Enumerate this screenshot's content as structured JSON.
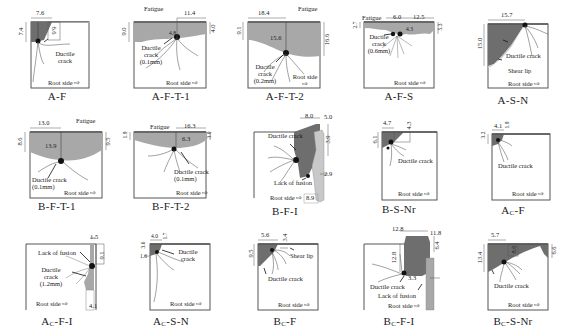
{
  "figure": {
    "root_side_label": "Root side ⇨",
    "panels": [
      {
        "id": "A-F",
        "caption": "A-F",
        "dims": [
          "7.6",
          "7.4",
          "6.6"
        ],
        "labels": [
          "Ductile crack"
        ]
      },
      {
        "id": "A-F-T-1",
        "caption": "A-F-T-1",
        "dims": [
          "9.0",
          "11.4",
          "4.8",
          "4.0"
        ],
        "labels": [
          "Fatigue",
          "Ductile crack (0.1mm)"
        ]
      },
      {
        "id": "A-F-T-2",
        "caption": "A-F-T-2",
        "dims": [
          "18.4",
          "9.1",
          "15.6",
          "16.6"
        ],
        "labels": [
          "Fatigue",
          "Ductile crack (0.2mm)",
          "Root side ⇨"
        ]
      },
      {
        "id": "A-F-S",
        "caption": "A-F-S",
        "dims": [
          "6.0",
          "12.5",
          "2.7",
          "4.3",
          "5.3"
        ],
        "labels": [
          "Fatigue",
          "Ductile crack (0.6mm)"
        ]
      },
      {
        "id": "A-S-N",
        "caption": "A-S-N",
        "dims": [
          "15.7",
          "15.0"
        ],
        "labels": [
          "Ductile crack",
          "Shear lip"
        ]
      },
      {
        "id": "B-F-T-1",
        "caption": "B-F-T-1",
        "dims": [
          "13.0",
          "8.6",
          "13.9",
          "9.5"
        ],
        "labels": [
          "Fatigue",
          "Ductile crack (0.1mm)"
        ]
      },
      {
        "id": "B-F-T-2",
        "caption": "B-F-T-2",
        "dims": [
          "16.3",
          "1.9",
          "6.3",
          "3.0"
        ],
        "labels": [
          "Fatigue",
          "Ductile crack (0.1mm)"
        ]
      },
      {
        "id": "B-F-I",
        "caption": "B-F-I",
        "dims": [
          "8.0",
          "5.0",
          "3.9",
          "2.9",
          "8.9"
        ],
        "labels": [
          "Ductile crack",
          "Lack of fusion"
        ]
      },
      {
        "id": "B-S-Nr",
        "caption": "B-S-Nr",
        "dims": [
          "4.7",
          "6.1",
          "4.3"
        ],
        "labels": [
          "Ductile crack"
        ]
      },
      {
        "id": "Ac-F",
        "caption_main": "A",
        "caption_sub": "C",
        "caption_rest": "-F",
        "dims": [
          "4.1",
          "3.2",
          "1.9"
        ],
        "labels": [
          "Ductile crack"
        ]
      },
      {
        "id": "Ac-F-I",
        "caption_main": "A",
        "caption_sub": "C",
        "caption_rest": "-F-I",
        "dims": [
          "1.5",
          "9.1",
          "4.1"
        ],
        "labels": [
          "Lack of fusion",
          "Ductile crack (1.2mm)"
        ]
      },
      {
        "id": "Ac-S-N",
        "caption_main": "A",
        "caption_sub": "C",
        "caption_rest": "-S-N",
        "dims": [
          "4.0",
          "3.6",
          "1.6",
          "1.7"
        ],
        "labels": [
          "Ductile crack"
        ]
      },
      {
        "id": "Bc-F",
        "caption_main": "B",
        "caption_sub": "C",
        "caption_rest": "-F",
        "dims": [
          "5.6",
          "9.5",
          "3.4"
        ],
        "labels": [
          "Shear lip",
          "Ductile crack"
        ]
      },
      {
        "id": "Bc-F-I",
        "caption_main": "B",
        "caption_sub": "C",
        "caption_rest": "-F-I",
        "dims": [
          "12.8",
          "11.8",
          "12.8",
          "6.4",
          "3.3"
        ],
        "labels": [
          "Ductile crack",
          "Lack of fusion"
        ]
      },
      {
        "id": "Bc-S-Nr",
        "caption_main": "B",
        "caption_sub": "C",
        "caption_rest": "-S-Nr",
        "dims": [
          "5.7",
          "13.4",
          "8.6",
          "6.6"
        ],
        "labels": [
          "Ductile crack"
        ]
      }
    ]
  },
  "colors": {
    "dark": "#6e6e6e",
    "mid": "#a8a8a8",
    "light": "#c8c8c8",
    "line": "#444444"
  }
}
